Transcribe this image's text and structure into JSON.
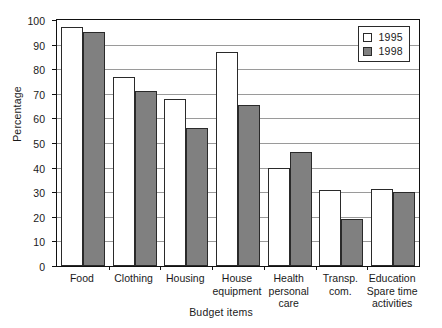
{
  "chart_data": {
    "type": "bar",
    "title": "",
    "xlabel": "Budget items",
    "ylabel": "Percentage",
    "ylim": [
      0,
      100
    ],
    "ytick_step": 10,
    "yticks": [
      0,
      10,
      20,
      30,
      40,
      50,
      60,
      70,
      80,
      90,
      100
    ],
    "grid": true,
    "legend_position": "top-right",
    "categories": [
      "Food",
      "Clothing",
      "Housing",
      "House\nequipment",
      "Health\npersonal\ncare",
      "Transp.\ncom.",
      "Education\nSpare time\nactivities"
    ],
    "series": [
      {
        "name": "1995",
        "color": "#ffffff",
        "values": [
          97,
          77,
          68,
          87,
          40,
          31,
          31.5
        ]
      },
      {
        "name": "1998",
        "color": "#808080",
        "values": [
          95,
          71,
          56,
          65.5,
          46.5,
          19,
          30
        ]
      }
    ]
  },
  "legend": {
    "items": [
      {
        "label": "1995",
        "swatch": "white-square-icon"
      },
      {
        "label": "1998",
        "swatch": "gray-square-icon"
      }
    ]
  }
}
